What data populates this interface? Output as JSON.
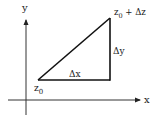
{
  "diagram": {
    "type": "complex-increment-triangle",
    "axes": {
      "x_label": "x",
      "y_label": "y"
    },
    "points": {
      "start": {
        "label_base": "z",
        "label_sub": "0"
      },
      "end": {
        "label_base": "z",
        "label_sub": "0",
        "label_suffix": " + Δz"
      }
    },
    "legs": {
      "horizontal": "Δx",
      "vertical": "Δy"
    },
    "colors": {
      "line": "#111111",
      "axis": "#333333",
      "text": "#222222"
    }
  }
}
